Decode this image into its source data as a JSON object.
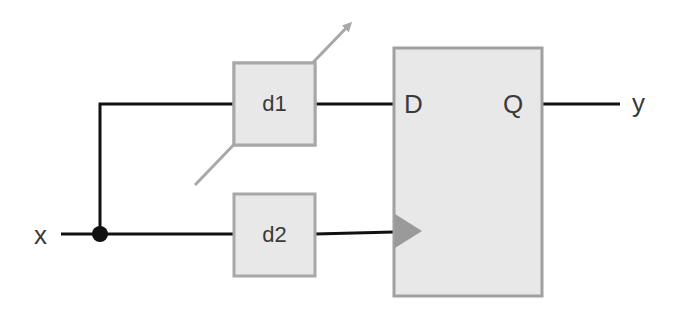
{
  "diagram": {
    "input_label": "x",
    "output_label": "y",
    "delay_blocks": [
      {
        "label": "d1",
        "adjustable": true
      },
      {
        "label": "d2",
        "adjustable": false
      }
    ],
    "flip_flop": {
      "d_label": "D",
      "q_label": "Q",
      "clock_input": "triangle"
    },
    "colors": {
      "wire": "#111111",
      "block_fill": "#e8e8e8",
      "block_border": "#a8a8a8",
      "arrow": "#a8a8a8",
      "clock_triangle": "#9a9a9a"
    }
  }
}
